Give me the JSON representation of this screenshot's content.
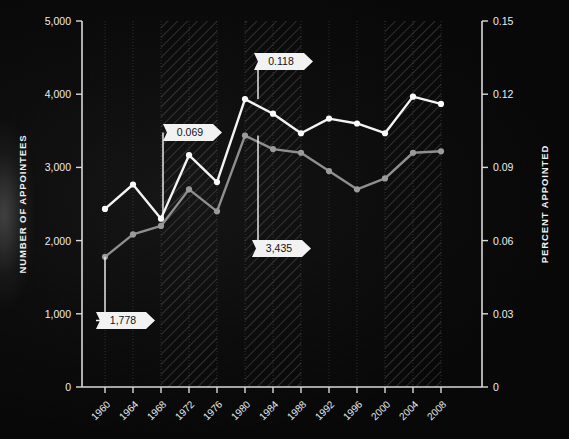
{
  "chart_data": {
    "type": "line",
    "title": "",
    "xlabel": "",
    "ylabel": "NUMBER OF APPOINTEES",
    "y2label": "PERCENT APPOINTED",
    "grid": true,
    "legend": "none",
    "categories": [
      "1960",
      "1964",
      "1968",
      "1972",
      "1976",
      "1980",
      "1984",
      "1988",
      "1992",
      "1996",
      "2000",
      "2004",
      "2008"
    ],
    "ylim": [
      0,
      5000
    ],
    "y2lim": [
      0,
      0.15
    ],
    "yticks": [
      "0",
      "1,000",
      "2,000",
      "3,000",
      "4,000",
      "5,000"
    ],
    "y2ticks": [
      "0",
      "0.03",
      "0.06",
      "0.09",
      "0.12",
      "0.15"
    ],
    "ytick_values": [
      0,
      1000,
      2000,
      3000,
      4000,
      5000
    ],
    "y2tick_values": [
      0,
      0.03,
      0.06,
      0.09,
      0.12,
      0.15
    ],
    "series": [
      {
        "name": "PERCENT APPOINTED",
        "axis": "right",
        "color": "#f3f3f3",
        "values": [
          0.073,
          0.083,
          0.069,
          0.095,
          0.084,
          0.118,
          0.112,
          0.104,
          0.11,
          0.108,
          0.104,
          0.119,
          0.116
        ]
      },
      {
        "name": "NUMBER OF APPOINTEES",
        "axis": "left",
        "color": "#8e8e8e",
        "values": [
          1778,
          2085,
          2200,
          2700,
          2400,
          3435,
          3250,
          3200,
          2950,
          2700,
          2850,
          3200,
          3220
        ]
      }
    ],
    "annotations": [
      {
        "label": "1,778",
        "series": "NUMBER OF APPOINTEES",
        "category": "1960",
        "value": 1778
      },
      {
        "label": "0.069",
        "series": "PERCENT APPOINTED",
        "category": "1968",
        "value": 0.069
      },
      {
        "label": "0.118",
        "series": "PERCENT APPOINTED",
        "category": "1980",
        "value": 0.118
      },
      {
        "label": "3,435",
        "series": "NUMBER OF APPOINTEES",
        "category": "1980",
        "value": 3435
      }
    ],
    "shaded_bands": [
      {
        "from": "1968",
        "to": "1976"
      },
      {
        "from": "1980",
        "to": "1988"
      },
      {
        "from": "2000",
        "to": "2008"
      }
    ],
    "colors": {
      "background": "#0a0a0a",
      "percent_line": "#f3f3f3",
      "number_line": "#8e8e8e",
      "axis": "#d9d9d9",
      "callout_fill": "#f2f2f2",
      "callout_text": "#111111",
      "band_hatch": "#8a8a8a"
    }
  }
}
